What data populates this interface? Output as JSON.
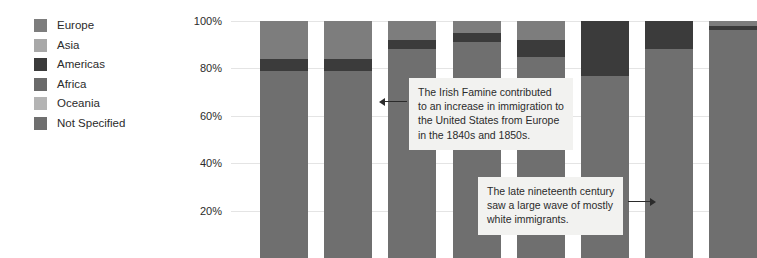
{
  "legend": {
    "items": [
      {
        "label": "Europe",
        "color": "#7d7d7d"
      },
      {
        "label": "Asia",
        "color": "#a8a8a8"
      },
      {
        "label": "Americas",
        "color": "#3b3b3b"
      },
      {
        "label": "Africa",
        "color": "#6a6a6a"
      },
      {
        "label": "Oceania",
        "color": "#b4b4b4"
      },
      {
        "label": "Not Specified",
        "color": "#6f6f6f"
      }
    ]
  },
  "annotations": [
    {
      "id": "irish-famine",
      "lines": [
        "The Irish Famine contributed",
        "to an increase in immigration to",
        "the United States from Europe",
        "in the 1840s and 1850s."
      ],
      "arrow": "left"
    },
    {
      "id": "late-nineteenth-century",
      "lines": [
        "The late nineteenth century",
        "saw a large wave of mostly",
        "white immigrants."
      ],
      "arrow": "right"
    }
  ],
  "chart_data": {
    "type": "bar",
    "stacked": true,
    "title": "",
    "xlabel": "",
    "ylabel": "",
    "ylim": [
      0,
      100
    ],
    "yticks": [
      "100%",
      "80%",
      "60%",
      "40%",
      "20%"
    ],
    "ytick_values": [
      100,
      80,
      60,
      40,
      20
    ],
    "grid": true,
    "legend_position": "left",
    "categories": [
      "1",
      "2",
      "3",
      "4",
      "5",
      "6",
      "7",
      "8"
    ],
    "series": [
      {
        "name": "Europe",
        "color": "#7d7d7d",
        "values": [
          16,
          16,
          8,
          5,
          8,
          0,
          0,
          2
        ]
      },
      {
        "name": "Americas",
        "color": "#3b3b3b",
        "values": [
          5,
          5,
          4,
          4,
          7,
          23,
          12,
          2
        ]
      },
      {
        "name": "Not Specified",
        "color": "#6f6f6f",
        "values": [
          79,
          79,
          88,
          91,
          85,
          77,
          88,
          96
        ]
      }
    ]
  }
}
